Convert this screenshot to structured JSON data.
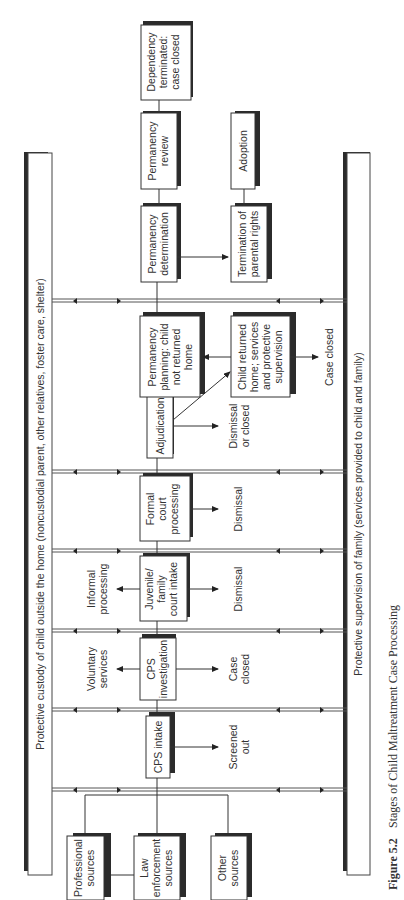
{
  "diagram": {
    "orientation": "rotated -90deg (landscape figure printed sideways)",
    "bands": {
      "top": "Protective custody of child outside the home (noncustodial parent, other relatives, foster care, shelter)",
      "bottom": "Protective supervision of family (services provided to child and family)"
    },
    "sources": [
      {
        "lines": [
          "Professional",
          "sources"
        ]
      },
      {
        "lines": [
          "Law",
          "enforcement",
          "sources"
        ]
      },
      {
        "lines": [
          "Other",
          "sources"
        ]
      }
    ],
    "stages": [
      {
        "id": "cps-intake",
        "lines": [
          "CPS intake"
        ],
        "outcome_below": [
          "Screened",
          "out"
        ]
      },
      {
        "id": "cps-investigation",
        "lines": [
          "CPS",
          "investigation"
        ],
        "outcome_above": [
          "Voluntary",
          "services"
        ],
        "outcome_below": [
          "Case",
          "closed"
        ]
      },
      {
        "id": "juvenile-court-intake",
        "lines": [
          "Juvenile/",
          "family",
          "court intake"
        ],
        "outcome_above": [
          "Informal",
          "processing"
        ],
        "outcome_below": [
          "Dismissal"
        ]
      },
      {
        "id": "formal-court-processing",
        "lines": [
          "Formal",
          "court",
          "processing"
        ],
        "outcome_below": [
          "Dismissal"
        ]
      },
      {
        "id": "adjudication",
        "lines": [
          "Adjudication"
        ],
        "outcome_below": [
          "Dismissal",
          "or closed"
        ]
      },
      {
        "id": "permanency-planning",
        "lines": [
          "Permanency",
          "planning: child",
          "not returned",
          "home"
        ]
      },
      {
        "id": "child-returned-home",
        "lines": [
          "Child returned",
          "home; services",
          "and protective",
          "supervision"
        ],
        "outcome_below": [
          "Case closed"
        ]
      },
      {
        "id": "permanency-determination",
        "lines": [
          "Permanency",
          "determination"
        ]
      },
      {
        "id": "termination-parental-rights",
        "lines": [
          "Termination of",
          "parental rights"
        ]
      },
      {
        "id": "permanency-review",
        "lines": [
          "Permanency",
          "review"
        ]
      },
      {
        "id": "adoption",
        "lines": [
          "Adoption"
        ]
      },
      {
        "id": "dependency-terminated",
        "lines": [
          "Dependency",
          "terminated:",
          "case closed"
        ]
      }
    ],
    "caption": {
      "number": "Figure 5.2",
      "title": "Stages of Child Maltreatment Case Processing"
    }
  },
  "colors": {
    "line": "#333333",
    "shadow": "#2b2b2b",
    "background": "#ffffff"
  }
}
